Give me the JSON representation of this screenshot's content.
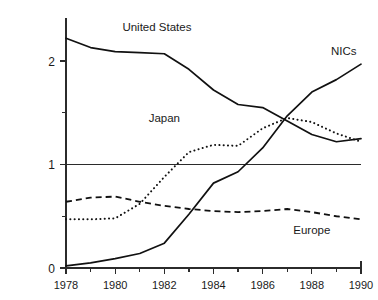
{
  "chart_data": {
    "type": "line",
    "title": "",
    "xlabel": "",
    "ylabel": "",
    "xlim": [
      1978,
      1990
    ],
    "ylim": [
      0,
      2.35
    ],
    "grid": false,
    "legend_position": "inline-annotations",
    "reference_line": 1,
    "x": [
      1978,
      1979,
      1980,
      1981,
      1982,
      1983,
      1984,
      1985,
      1986,
      1987,
      1988,
      1989,
      1990
    ],
    "x_tick_labels": [
      "1978",
      "1980",
      "1982",
      "1984",
      "1986",
      "1988",
      "1990"
    ],
    "x_tick_values": [
      1978,
      1980,
      1982,
      1984,
      1986,
      1988,
      1990
    ],
    "x_minor_ticks": [
      1979,
      1981,
      1983,
      1985,
      1987,
      1989
    ],
    "y_tick_labels": [
      "0",
      "1",
      "2"
    ],
    "y_tick_values": [
      0,
      1,
      2
    ],
    "y_minor_ticks": [
      0.5,
      1.5
    ],
    "series": [
      {
        "name": "United States",
        "style": "solid",
        "label": "United States",
        "values": [
          2.22,
          2.13,
          2.09,
          2.08,
          2.07,
          1.92,
          1.72,
          1.58,
          1.55,
          1.42,
          1.29,
          1.22,
          1.25
        ]
      },
      {
        "name": "NICs",
        "style": "solid",
        "label": "NICs",
        "values": [
          0.02,
          0.05,
          0.09,
          0.14,
          0.24,
          0.52,
          0.82,
          0.93,
          1.16,
          1.47,
          1.7,
          1.82,
          1.97
        ]
      },
      {
        "name": "Japan",
        "style": "dotted",
        "label": "Japan",
        "values": [
          0.47,
          0.47,
          0.48,
          0.62,
          0.88,
          1.12,
          1.19,
          1.18,
          1.35,
          1.45,
          1.41,
          1.3,
          1.22
        ]
      },
      {
        "name": "Europe",
        "style": "dashed",
        "label": "Europe",
        "values": [
          0.64,
          0.68,
          0.69,
          0.64,
          0.6,
          0.57,
          0.55,
          0.54,
          0.55,
          0.57,
          0.54,
          0.5,
          0.47
        ]
      }
    ],
    "annotations": [
      {
        "text": "United States",
        "x": 1981.7,
        "y": 2.29
      },
      {
        "text": "NICs",
        "x": 1989.3,
        "y": 2.06
      },
      {
        "text": "Japan",
        "x": 1982.0,
        "y": 1.41
      },
      {
        "text": "Europe",
        "x": 1988.0,
        "y": 0.33
      }
    ]
  }
}
